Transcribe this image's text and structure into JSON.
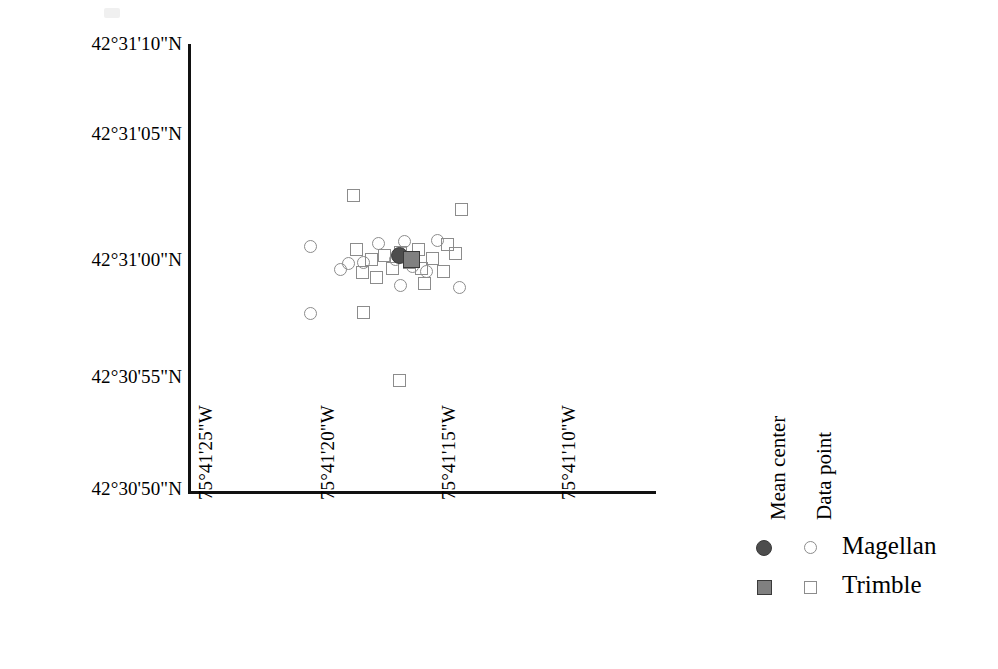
{
  "figure": {
    "kind": "scatter-plot",
    "background_color": "#ffffff",
    "axis_color": "#111111"
  },
  "axes": {
    "y_ticks": [
      "42°31'10\"N",
      "42°31'05\"N",
      "42°31'00\"N",
      "42°30'55\"N",
      "42°30'50\"N"
    ],
    "x_ticks": [
      "75°41'25\"W",
      "75°41'20\"W",
      "75°41'15\"W",
      "75°41'10\"W"
    ],
    "x_label": "",
    "y_label": ""
  },
  "legend": {
    "headers": [
      "Mean center",
      "Data point"
    ],
    "rows": [
      {
        "label": "Magellan",
        "mean_marker": "filled-circle",
        "data_marker": "open-circle"
      },
      {
        "label": "Trimble",
        "mean_marker": "filled-square",
        "data_marker": "open-square"
      }
    ],
    "colors": {
      "magellan_mean": "#4d4d4d",
      "trimble_mean": "#808080",
      "data_point_outline": "#8c8c8c"
    }
  },
  "chart_data": {
    "type": "scatter",
    "title": "",
    "xlabel": "",
    "ylabel": "",
    "grid": false,
    "legend_position": "right",
    "x_unit": "longitude-west-seconds",
    "y_unit": "latitude-north-seconds",
    "xlim": [
      "75°41'25\"W",
      "75°41'05.8\"W"
    ],
    "ylim": [
      "42°30'50\"N",
      "42°31'10\"N"
    ],
    "xticks": [
      "75°41'25\"W",
      "75°41'20\"W",
      "75°41'15\"W",
      "75°41'10\"W"
    ],
    "yticks": [
      "42°30'50\"N",
      "42°30'55\"N",
      "42°31'00\"N",
      "42°31'05\"N",
      "42°31'10\"N"
    ],
    "series": [
      {
        "name": "Magellan",
        "marker": "open-circle",
        "role": "data-point",
        "points": [
          {
            "px": 310,
            "py": 246
          },
          {
            "px": 310,
            "py": 313
          },
          {
            "px": 378,
            "py": 243
          },
          {
            "px": 363,
            "py": 262
          },
          {
            "px": 395,
            "py": 259
          },
          {
            "px": 404,
            "py": 241
          },
          {
            "px": 412,
            "py": 266
          },
          {
            "px": 340,
            "py": 269
          },
          {
            "px": 348,
            "py": 263
          },
          {
            "px": 400,
            "py": 285
          },
          {
            "px": 437,
            "py": 240
          },
          {
            "px": 426,
            "py": 271
          },
          {
            "px": 459,
            "py": 287
          }
        ]
      },
      {
        "name": "Trimble",
        "marker": "open-square",
        "role": "data-point",
        "points": [
          {
            "px": 353,
            "py": 195
          },
          {
            "px": 461,
            "py": 209
          },
          {
            "px": 356,
            "py": 249
          },
          {
            "px": 371,
            "py": 259
          },
          {
            "px": 362,
            "py": 272
          },
          {
            "px": 376,
            "py": 277
          },
          {
            "px": 384,
            "py": 255
          },
          {
            "px": 392,
            "py": 268
          },
          {
            "px": 400,
            "py": 252
          },
          {
            "px": 409,
            "py": 262
          },
          {
            "px": 418,
            "py": 249
          },
          {
            "px": 421,
            "py": 268
          },
          {
            "px": 432,
            "py": 258
          },
          {
            "px": 443,
            "py": 271
          },
          {
            "px": 447,
            "py": 244
          },
          {
            "px": 455,
            "py": 253
          },
          {
            "px": 424,
            "py": 283
          },
          {
            "px": 363,
            "py": 312
          },
          {
            "px": 399,
            "py": 380
          }
        ]
      },
      {
        "name": "Magellan mean center",
        "marker": "filled-circle",
        "role": "mean-center",
        "points": [
          {
            "px": 399,
            "py": 255
          }
        ]
      },
      {
        "name": "Trimble mean center",
        "marker": "filled-square",
        "role": "mean-center",
        "points": [
          {
            "px": 411,
            "py": 259
          }
        ]
      }
    ],
    "pixel_mapping": {
      "x_origin_px": 190,
      "x_px_per_5sec": 121,
      "y_origin_px": 492,
      "y_px_per_5sec": 45
    }
  }
}
